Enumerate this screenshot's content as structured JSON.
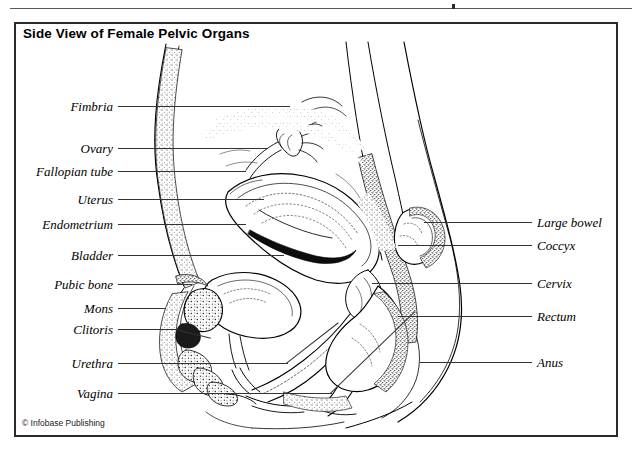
{
  "figure": {
    "title": "Side View of Female Pelvic Organs",
    "credit": "© Infobase Publishing",
    "type": "anatomical-illustration",
    "style": "black-and-white stippled line art",
    "background_color": "#ffffff",
    "line_color": "#000000",
    "frame_color": "#2b2b2b"
  },
  "labels": {
    "left": [
      {
        "text": "Fimbria",
        "y": 106,
        "leader_end_x": 300
      },
      {
        "text": "Ovary",
        "y": 148,
        "leader_end_x": 300
      },
      {
        "text": "Fallopian tube",
        "y": 171,
        "leader_end_x": 300
      },
      {
        "text": "Uterus",
        "y": 199,
        "leader_end_x": 300
      },
      {
        "text": "Endometrium",
        "y": 224,
        "leader_end_x": 300
      },
      {
        "text": "Bladder",
        "y": 255,
        "leader_end_x": 300
      },
      {
        "text": "Pubic bone",
        "y": 284,
        "leader_end_x": 300
      },
      {
        "text": "Mons",
        "y": 308,
        "leader_end_x": 300
      },
      {
        "text": "Clitoris",
        "y": 329,
        "leader_end_x": 300
      },
      {
        "text": "Urethra",
        "y": 363,
        "leader_end_x": 300
      },
      {
        "text": "Vagina",
        "y": 393,
        "leader_end_x": 300
      }
    ],
    "right": [
      {
        "text": "Large bowel",
        "y": 222,
        "leader_start_x": 430
      },
      {
        "text": "Coccyx",
        "y": 245,
        "leader_start_x": 430
      },
      {
        "text": "Cervix",
        "y": 283,
        "leader_start_x": 430
      },
      {
        "text": "Rectum",
        "y": 316,
        "leader_start_x": 430
      },
      {
        "text": "Anus",
        "y": 362,
        "leader_start_x": 430
      }
    ]
  }
}
